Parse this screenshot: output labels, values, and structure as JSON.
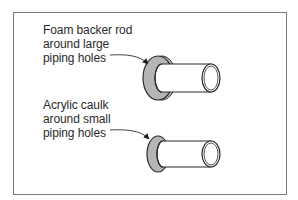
{
  "diagram": {
    "title": "",
    "callouts": [
      {
        "id": "large-holes",
        "text": "Foam backer rod\naround large\npiping holes",
        "target": "large-pipe-seal-ring"
      },
      {
        "id": "small-holes",
        "text": "Acrylic caulk\naround small\npiping holes",
        "target": "small-pipe-seal-ring"
      }
    ],
    "elements": [
      {
        "name": "large-pipe",
        "seal": "foam backer rod ring"
      },
      {
        "name": "small-pipe",
        "seal": "acrylic caulk ring"
      }
    ],
    "colors": {
      "frame": "#7a7a7a",
      "outline": "#2b2b2b",
      "seal_fill": "#b5b5b5",
      "pipe_fill": "#ffffff",
      "text": "#2a2a2a"
    }
  }
}
